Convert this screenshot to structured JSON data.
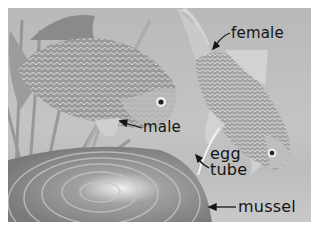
{
  "figure": {
    "colors": {
      "background": "#ffffff",
      "water": "#bfbfbf",
      "label_text": "#141414"
    },
    "labels": {
      "female": "female",
      "male": "male",
      "egg": "egg",
      "tube": "tube",
      "mussel": "mussel"
    }
  }
}
